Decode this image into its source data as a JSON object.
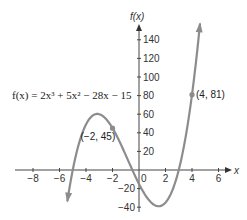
{
  "chart_data": {
    "type": "line",
    "title": "",
    "function_label": "f(x) = 2x³ + 5x² − 28x − 15",
    "xlabel": "x",
    "ylabel": "f(x)",
    "xlim": [
      -9,
      6.5
    ],
    "ylim": [
      -45,
      150
    ],
    "grid": false,
    "x_ticks": [
      -8,
      -6,
      -4,
      -2,
      0,
      2,
      4,
      6
    ],
    "y_ticks": [
      -40,
      -20,
      20,
      40,
      60,
      80,
      100,
      120,
      140
    ],
    "x_tick_labels": [
      "−8",
      "−6",
      "−4",
      "−2",
      "0",
      "2",
      "4",
      "6"
    ],
    "y_tick_labels": [
      "−40",
      "−20",
      "20",
      "40",
      "60",
      "80",
      "100",
      "120",
      "140"
    ],
    "curve": {
      "coefficients": [
        2,
        5,
        -28,
        -15
      ],
      "x_range": [
        -5.4,
        4.6
      ],
      "color": "#8c8c8c"
    },
    "points": [
      {
        "x": -2,
        "y": 45,
        "label": "(−2, 45)"
      },
      {
        "x": 4,
        "y": 81,
        "label": "(4, 81)"
      }
    ],
    "annotations": [
      "(−2, 45)",
      "(4, 81)",
      "f(x) = 2x³ + 5x² − 28x − 15"
    ]
  },
  "axes": {
    "x_name": "x",
    "y_name": "f(x)"
  }
}
